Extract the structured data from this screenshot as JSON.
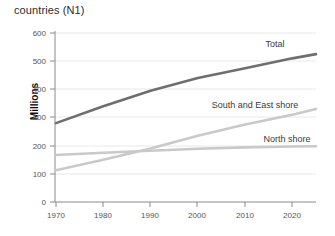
{
  "caption": "countries (N1)",
  "chart_data": {
    "type": "line",
    "title": "countries (N1)",
    "xlabel": "",
    "ylabel": "Millions",
    "xlim": [
      1970,
      2025
    ],
    "ylim": [
      0,
      600
    ],
    "yticks": [
      0,
      100,
      200,
      300,
      400,
      500,
      600
    ],
    "xticks": [
      1970,
      1980,
      1990,
      2000,
      2010,
      2020
    ],
    "grid": true,
    "legend_position": "inline-right",
    "x": [
      1970,
      1980,
      1990,
      2000,
      2010,
      2020,
      2025
    ],
    "series": [
      {
        "name": "Total",
        "color": "#6e6e6e",
        "values": [
          280,
          340,
          395,
          440,
          475,
          510,
          525
        ]
      },
      {
        "name": "South and East shore",
        "color": "#c9c9c9",
        "values": [
          113,
          150,
          190,
          235,
          275,
          310,
          330
        ]
      },
      {
        "name": "North shore",
        "color": "#c9c9c9",
        "values": [
          167,
          175,
          182,
          189,
          194,
          197,
          198
        ]
      }
    ],
    "annotations": [
      {
        "text": "Total",
        "x": 2016,
        "y": 545
      },
      {
        "text": "South and East shore",
        "x": 2003,
        "y": 330
      },
      {
        "text": "North shore",
        "x": 2013,
        "y": 212
      }
    ]
  },
  "axis": {
    "y_tick_labels": [
      "600",
      "500",
      "400",
      "300",
      "200",
      "100",
      "0"
    ],
    "x_tick_labels": [
      "1970",
      "1980",
      "1990",
      "2000",
      "2010",
      "2020"
    ],
    "y_axis_title": "Millions"
  },
  "colors": {
    "total_line": "#6e6e6e",
    "light_line": "#c9c9c9",
    "grid": "#e2e2e2",
    "axis": "#8a8a8a",
    "text": "#2b2b2b"
  }
}
